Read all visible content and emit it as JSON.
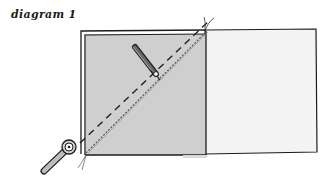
{
  "caption": "diagram 1",
  "colors": {
    "outline": "#1c1c1c",
    "gray_square_fill": "#cfcfcf",
    "white_square_fill": "#f4f4f4",
    "background": "#ffffff"
  },
  "elements": {
    "gray_square": "shaded fabric square (layered on top)",
    "white_square": "light fabric square (underneath)",
    "diagonal_dashed_line": "pencil-drawn diagonal guide line",
    "diagonal_stitch_line": "dotted stitching line beside diagonal",
    "pencil": "pencil marking the diagonal",
    "rotary_cutter": "cutter at bottom-left corner"
  }
}
